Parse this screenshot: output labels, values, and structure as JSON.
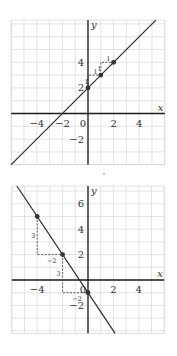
{
  "chart_data": [
    {
      "type": "line",
      "title": "",
      "xlabel": "x",
      "ylabel": "y",
      "xlim": [
        -6,
        6
      ],
      "ylim": [
        -4,
        7.3
      ],
      "grid": true,
      "x_ticks": [
        -4,
        -2,
        0,
        2,
        4
      ],
      "x_tick_labels": [
        "−4",
        "−2",
        "0",
        "2",
        "4"
      ],
      "y_ticks": [
        -2,
        2,
        4
      ],
      "y_tick_labels": [
        "−2",
        "2",
        "4"
      ],
      "equation": "y = x + 2",
      "slope": 1,
      "intercept": 2,
      "points": [
        {
          "x": 0,
          "y": 2
        },
        {
          "x": 1,
          "y": 3
        },
        {
          "x": 2,
          "y": 4
        }
      ],
      "rise_run_annotations": [
        {
          "from": [
            0,
            2
          ],
          "to": [
            1,
            3
          ],
          "run_label": "1",
          "rise_label": "1"
        },
        {
          "from": [
            1,
            3
          ],
          "to": [
            2,
            4
          ],
          "run_label": "1",
          "rise_label": "1"
        }
      ],
      "layout": {
        "origin_px": [
          88,
          113.5
        ],
        "unit_px": 12.8
      }
    },
    {
      "type": "line",
      "title": "",
      "xlabel": "x",
      "ylabel": "y",
      "xlim": [
        -6,
        6
      ],
      "ylim": [
        -4.2,
        7.4
      ],
      "grid": true,
      "x_ticks": [
        -4,
        0,
        2,
        4
      ],
      "x_tick_labels": [
        "−4",
        "0",
        "2",
        "4"
      ],
      "y_ticks": [
        -2,
        2,
        4,
        6
      ],
      "y_tick_labels": [
        "−2",
        "2",
        "4",
        "6"
      ],
      "equation": "y = -3/2 x - 1",
      "slope": -1.5,
      "intercept": -1,
      "points": [
        {
          "x": -4,
          "y": 5
        },
        {
          "x": -2,
          "y": 2
        },
        {
          "x": 0,
          "y": -1
        }
      ],
      "rise_run_annotations": [
        {
          "from": [
            -4,
            5
          ],
          "to": [
            -2,
            2
          ],
          "rise_label": "3",
          "run_label": "−2"
        },
        {
          "from": [
            -2,
            2
          ],
          "to": [
            0,
            -1
          ],
          "rise_label": "3",
          "run_label": "−2"
        }
      ],
      "layout": {
        "origin_px": [
          88,
          280
        ],
        "unit_px": 12.7
      }
    }
  ]
}
